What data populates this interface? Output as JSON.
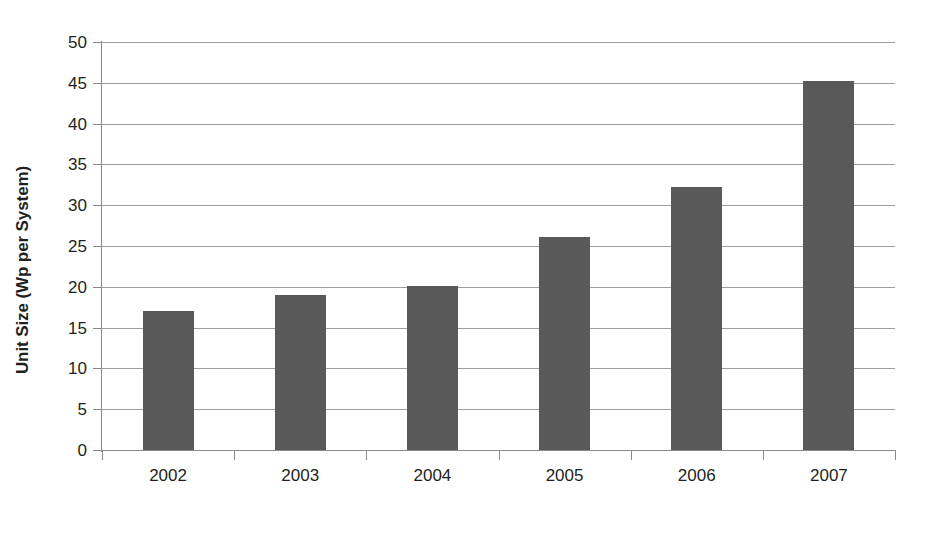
{
  "chart_data": {
    "type": "bar",
    "title": "",
    "subtitle": "",
    "xlabel": "",
    "ylabel": "Unit Size (Wp per System)",
    "categories": [
      "2002",
      "2003",
      "2004",
      "2005",
      "2006",
      "2007"
    ],
    "values": [
      17.0,
      19.0,
      20.1,
      26.1,
      32.2,
      45.2
    ],
    "series": [
      {
        "name": "Unit Size",
        "values": [
          17.0,
          19.0,
          20.1,
          26.1,
          32.2,
          45.2
        ]
      }
    ],
    "ylim": [
      0,
      50
    ],
    "ytick_labels": [
      "0",
      "5",
      "10",
      "15",
      "20",
      "25",
      "30",
      "35",
      "40",
      "45",
      "50"
    ],
    "ytick_values": [
      0,
      5,
      10,
      15,
      20,
      25,
      30,
      35,
      40,
      45,
      50
    ],
    "grid": true,
    "grid_axis": "y",
    "legend": false,
    "legend_position": "none",
    "bar_color": "#595959",
    "gridline_color": "#9d9d9d",
    "axis_color": "#8a8a8a",
    "background_color": "#ffffff",
    "text_color": "#231f20",
    "annotations": []
  }
}
